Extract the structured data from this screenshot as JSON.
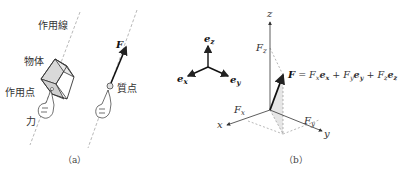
{
  "panel_a": {
    "caption": "（a）",
    "labels": {
      "line_of_action": "作用線",
      "body": "物体",
      "point_of_action": "作用点",
      "force": "力",
      "particle": "質点",
      "force_vector": "F"
    }
  },
  "panel_b": {
    "caption": "（b）",
    "basis": {
      "ez": {
        "base": "e",
        "sub": "z"
      },
      "ex": {
        "base": "e",
        "sub": "x"
      },
      "ey": {
        "base": "e",
        "sub": "y"
      }
    },
    "axes": {
      "x": "x",
      "y": "y",
      "z": "z"
    },
    "components": {
      "Fx": {
        "base": "F",
        "sub": "x"
      },
      "Fy": {
        "base": "F",
        "sub": "y"
      },
      "Fz": {
        "base": "F",
        "sub": "z"
      }
    },
    "equation": {
      "lhs": "F",
      "eq": " = ",
      "t1": {
        "coef": "F",
        "coef_sub": "x",
        "vec": "e",
        "vec_sub": "x"
      },
      "plus1": " + ",
      "t2": {
        "coef": "F",
        "coef_sub": "y",
        "vec": "e",
        "vec_sub": "y"
      },
      "plus2": " + ",
      "t3": {
        "coef": "F",
        "coef_sub": "z",
        "vec": "e",
        "vec_sub": "z"
      }
    }
  },
  "colors": {
    "line": "#333333",
    "dash": "#888888",
    "box_fill": "#d9d9d9",
    "shade": "#e6e6e6"
  }
}
